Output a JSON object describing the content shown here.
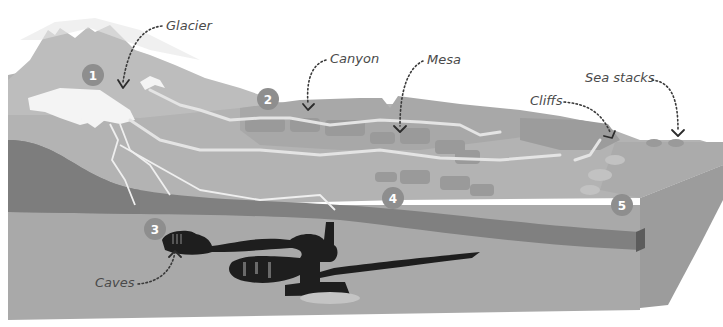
{
  "diagram": {
    "labels": {
      "glacier": "Glacier",
      "canyon": "Canyon",
      "mesa": "Mesa",
      "cliffs": "Cliffs",
      "sea_stacks": "Sea stacks",
      "caves": "Caves"
    },
    "badges": [
      "1",
      "2",
      "3",
      "4",
      "5"
    ],
    "colors": {
      "sky": "#ffffff",
      "mountain": "#bdbdbd",
      "land_surface": "#b3b3b3",
      "mesa_blocks": "#9e9e9e",
      "dark_rock_band": "#808080",
      "ground": "#a9a9a9",
      "cave": "#1e1e1e",
      "river": "#e4e4e4",
      "badge": "#8e8e8e",
      "side_face": "#9c9c9c"
    }
  }
}
